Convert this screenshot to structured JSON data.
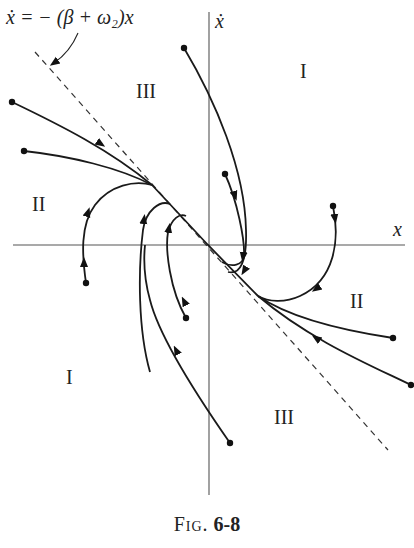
{
  "figure": {
    "caption_prefix": "Fig.",
    "caption_number": "6-8"
  },
  "axes": {
    "x_label": "x",
    "y_label": "ẋ",
    "origin": [
      208,
      245
    ]
  },
  "asymptote": {
    "equation": "ẋ = − (β + ω₂)x",
    "style": "dashed"
  },
  "regions": [
    {
      "label": "I",
      "position": "upper-right"
    },
    {
      "label": "III",
      "position": "upper-left"
    },
    {
      "label": "II",
      "position": "left"
    },
    {
      "label": "II",
      "position": "right"
    },
    {
      "label": "I",
      "position": "lower-left"
    },
    {
      "label": "III",
      "position": "lower-right"
    }
  ],
  "trajectory_count": 12,
  "colors": {
    "line": "#1a1a1a",
    "axis": "#555555",
    "background": "#ffffff"
  }
}
